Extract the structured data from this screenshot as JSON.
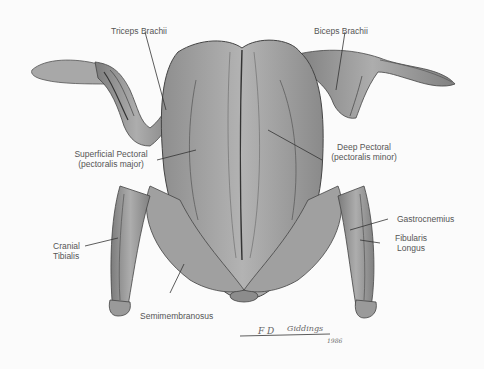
{
  "diagram": {
    "labels": [
      {
        "id": "triceps",
        "text": "Triceps Brachii"
      },
      {
        "id": "biceps",
        "text": "Biceps Brachii"
      },
      {
        "id": "sup_pectoral_1",
        "text": "Superficial Pectoral"
      },
      {
        "id": "sup_pectoral_2",
        "text": "(pectoralis major)"
      },
      {
        "id": "deep_pectoral_1",
        "text": "Deep Pectoral"
      },
      {
        "id": "deep_pectoral_2",
        "text": "(pectoralis minor)"
      },
      {
        "id": "cranial_1",
        "text": "Cranial"
      },
      {
        "id": "cranial_2",
        "text": "Tibialis"
      },
      {
        "id": "gastro",
        "text": "Gastrocnemius"
      },
      {
        "id": "fibularis_1",
        "text": "Fibularis"
      },
      {
        "id": "fibularis_2",
        "text": "Longus"
      },
      {
        "id": "semimem",
        "text": "Semimembranosus"
      }
    ],
    "signature": {
      "name": "Giddings",
      "initials": "F D",
      "year": "1986"
    },
    "colors": {
      "background": "#fbfbfb",
      "muscle": "#9a9a9a",
      "muscle_dark": "#6e6e6e",
      "muscle_light": "#b8b8b8",
      "line": "#333333",
      "text": "#555555"
    }
  }
}
